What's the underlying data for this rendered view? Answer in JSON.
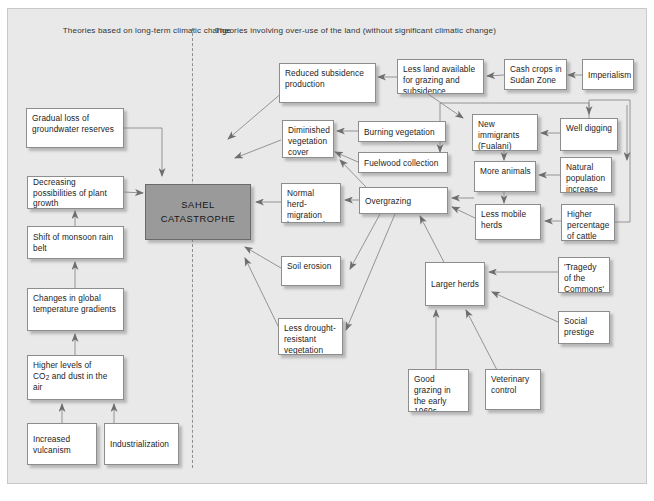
{
  "figure": {
    "headers": {
      "left": "Theories based on long-term climatic change",
      "right": "Theories involving over-use of the land (without significant climatic change)"
    },
    "center_node": {
      "line1": "SAHEL",
      "line2": "CATASTROPHE",
      "fill": "#9a9a9a"
    },
    "colors": {
      "background": "#e9e9e9",
      "node_fill": "#ffffff",
      "node_border": "#8d8d8d",
      "arrow": "#6e6e6e",
      "divider": "#8e8e8e"
    }
  },
  "nodes": {
    "gradual_loss": "Gradual loss of groundwater reserves",
    "decreasing_possibilities": "Decreasing possibilities of plant growth",
    "shift_monsoon": "Shift of monsoon rain belt",
    "changes_global_temp": "Changes in global temperature gradients",
    "higher_levels_co2_a": "Higher levels of",
    "higher_levels_co2_b": "CO",
    "higher_levels_co2_sub": "2",
    "higher_levels_co2_c": " and dust in the air",
    "increased_vulcanism": "Increased vulcanism",
    "industrialization": "Industrialization",
    "reduced_subsidence": "Reduced subsidence production",
    "diminished_vegetation": "Diminished vegetation cover",
    "burning_vegetation": "Burning vegetation",
    "fuelwood_collection": "Fuelwood collection",
    "normal_herd_migration": "Normal herd-migration hampered",
    "soil_erosion": "Soil erosion",
    "less_drought_resistant": "Less drought-resistant vegetation",
    "overgrazing": "Overgrazing",
    "less_land_available": "Less land available for grazing and subsidence",
    "cash_crops": "Cash crops in Sudan Zone",
    "imperialism": "Imperialism",
    "new_immigrants": "New immigrants (Fualani)",
    "well_digging": "Well digging",
    "more_animals": "More animals",
    "natural_population_increase": "Natural population increase",
    "less_mobile_herds": "Less mobile herds",
    "higher_percentage_cattle": "Higher percentage of cattle",
    "larger_herds": "Larger herds",
    "tragedy_commons": "'Tragedy of the Commons'",
    "social_prestige": "Social prestige",
    "good_grazing": "Good grazing in the early 1960s",
    "veterinary_control": "Veterinary control"
  }
}
